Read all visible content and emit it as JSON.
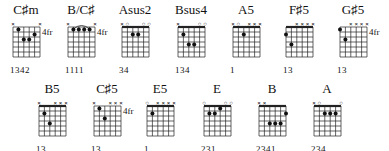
{
  "chords": [
    {
      "name": "C♯m",
      "x": 6,
      "y": 3,
      "fret_label": "4fr",
      "fingering": "1342",
      "strings": [
        "x",
        "",
        "",
        "",
        "",
        "x"
      ],
      "nut": false,
      "barre": null,
      "dots": [
        [
          2,
          1
        ],
        [
          3,
          3
        ],
        [
          4,
          3
        ],
        [
          5,
          2
        ]
      ]
    },
    {
      "name": "B/C♯",
      "x": 61,
      "y": 3,
      "fret_label": "4fr",
      "fingering": "1111",
      "strings": [
        "x",
        "",
        "",
        "",
        "",
        "x"
      ],
      "nut": false,
      "barre": {
        "from": 2,
        "to": 5,
        "fret": 1
      },
      "dots": [
        [
          2,
          1
        ],
        [
          3,
          1
        ],
        [
          4,
          1
        ],
        [
          5,
          1
        ]
      ]
    },
    {
      "name": "Asus2",
      "x": 115,
      "y": 3,
      "fret_label": "",
      "fingering": "34",
      "strings": [
        "x",
        "o",
        "",
        "",
        "o",
        "o"
      ],
      "nut": true,
      "barre": null,
      "dots": [
        [
          3,
          2
        ],
        [
          4,
          2
        ]
      ]
    },
    {
      "name": "Bsus4",
      "x": 171,
      "y": 3,
      "fret_label": "",
      "fingering": "134",
      "strings": [
        "x",
        "",
        "",
        "",
        "o",
        "o"
      ],
      "nut": true,
      "barre": null,
      "dots": [
        [
          2,
          2
        ],
        [
          3,
          4
        ],
        [
          4,
          4
        ]
      ]
    },
    {
      "name": "A5",
      "x": 226,
      "y": 3,
      "fret_label": "",
      "fingering": "1",
      "strings": [
        "x",
        "o",
        "",
        "x",
        "x",
        "x"
      ],
      "nut": true,
      "barre": null,
      "dots": [
        [
          3,
          2
        ]
      ]
    },
    {
      "name": "F♯5",
      "x": 279,
      "y": 3,
      "fret_label": "",
      "fingering": "13",
      "strings": [
        "",
        "",
        "x",
        "x",
        "x",
        "x"
      ],
      "nut": true,
      "barre": null,
      "dots": [
        [
          1,
          2
        ],
        [
          2,
          4
        ]
      ]
    },
    {
      "name": "G♯5",
      "x": 333,
      "y": 3,
      "fret_label": "4fr",
      "fingering": "13",
      "strings": [
        "",
        "",
        "x",
        "x",
        "x",
        "x"
      ],
      "nut": false,
      "barre": null,
      "dots": [
        [
          1,
          1
        ],
        [
          2,
          3
        ]
      ]
    },
    {
      "name": "B5",
      "x": 32,
      "y": 82,
      "fret_label": "",
      "fingering": "13",
      "strings": [
        "x",
        "",
        "",
        "x",
        "x",
        "x"
      ],
      "nut": true,
      "barre": null,
      "dots": [
        [
          2,
          2
        ],
        [
          3,
          4
        ]
      ]
    },
    {
      "name": "C♯5",
      "x": 87,
      "y": 82,
      "fret_label": "4fr",
      "fingering": "13",
      "strings": [
        "x",
        "",
        "",
        "x",
        "x",
        "x"
      ],
      "nut": false,
      "barre": null,
      "dots": [
        [
          2,
          1
        ],
        [
          3,
          3
        ]
      ]
    },
    {
      "name": "E5",
      "x": 140,
      "y": 82,
      "fret_label": "",
      "fingering": "1",
      "strings": [
        "o",
        "",
        "x",
        "x",
        "x",
        "x"
      ],
      "nut": true,
      "barre": null,
      "dots": [
        [
          2,
          2
        ]
      ]
    },
    {
      "name": "E",
      "x": 197,
      "y": 82,
      "fret_label": "",
      "fingering": "231",
      "strings": [
        "o",
        "",
        "",
        "",
        "o",
        "o"
      ],
      "nut": true,
      "barre": null,
      "dots": [
        [
          2,
          2
        ],
        [
          3,
          2
        ],
        [
          4,
          1
        ]
      ]
    },
    {
      "name": "B",
      "x": 252,
      "y": 82,
      "fret_label": "",
      "fingering": "2341",
      "strings": [
        "x",
        "x",
        "",
        "",
        "",
        ""
      ],
      "nut": true,
      "barre": null,
      "dots": [
        [
          3,
          4
        ],
        [
          4,
          4
        ],
        [
          5,
          4
        ],
        [
          6,
          2
        ]
      ]
    },
    {
      "name": "A",
      "x": 307,
      "y": 82,
      "fret_label": "",
      "fingering": "234",
      "strings": [
        "x",
        "o",
        "",
        "",
        "",
        "o"
      ],
      "nut": true,
      "barre": null,
      "dots": [
        [
          3,
          2
        ],
        [
          4,
          2
        ],
        [
          5,
          2
        ]
      ]
    }
  ]
}
